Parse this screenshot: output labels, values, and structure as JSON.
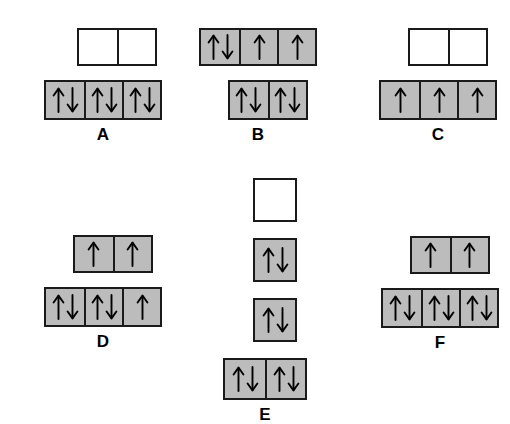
{
  "figure": {
    "background_color": "#ffffff",
    "box_fill_color": "#bcbcbc",
    "box_empty_color": "#ffffff",
    "box_border_color": "#1a1a1a",
    "arrow_color": "#000000"
  },
  "diagrams": [
    {
      "id": "A",
      "label": "A",
      "left": 44,
      "top": 28,
      "layout": "two-rows",
      "rows": [
        {
          "name": "upper-row",
          "box_width": 38,
          "box_height": 34,
          "offset_left": 27,
          "boxes": [
            {
              "fill": "empty",
              "electrons": ""
            },
            {
              "fill": "empty",
              "electrons": ""
            }
          ]
        },
        {
          "name": "lower-row",
          "box_width": 38,
          "box_height": 36,
          "offset_left": 0,
          "boxes": [
            {
              "fill": "filled",
              "electrons": "up-down"
            },
            {
              "fill": "filled",
              "electrons": "up-down"
            },
            {
              "fill": "filled",
              "electrons": "up-down"
            }
          ]
        }
      ]
    },
    {
      "id": "B",
      "label": "B",
      "left": 199,
      "top": 28,
      "layout": "two-rows",
      "rows": [
        {
          "name": "upper-row",
          "box_width": 38,
          "box_height": 34,
          "offset_left": 0,
          "boxes": [
            {
              "fill": "filled",
              "electrons": "up-down"
            },
            {
              "fill": "filled",
              "electrons": "up"
            },
            {
              "fill": "filled",
              "electrons": "up"
            }
          ]
        },
        {
          "name": "lower-row",
          "box_width": 38,
          "box_height": 36,
          "offset_left": 19,
          "boxes": [
            {
              "fill": "filled",
              "electrons": "up-down"
            },
            {
              "fill": "filled",
              "electrons": "up-down"
            }
          ]
        }
      ]
    },
    {
      "id": "C",
      "label": "C",
      "left": 379,
      "top": 28,
      "layout": "two-rows",
      "rows": [
        {
          "name": "upper-row",
          "box_width": 38,
          "box_height": 34,
          "offset_left": 19,
          "boxes": [
            {
              "fill": "empty",
              "electrons": ""
            },
            {
              "fill": "empty",
              "electrons": ""
            }
          ]
        },
        {
          "name": "lower-row",
          "box_width": 38,
          "box_height": 36,
          "offset_left": 0,
          "boxes": [
            {
              "fill": "filled",
              "electrons": "up"
            },
            {
              "fill": "filled",
              "electrons": "up"
            },
            {
              "fill": "filled",
              "electrons": "up"
            }
          ]
        }
      ]
    },
    {
      "id": "D",
      "label": "D",
      "left": 44,
      "top": 235,
      "layout": "two-rows",
      "rows": [
        {
          "name": "upper-row",
          "box_width": 38,
          "box_height": 34,
          "offset_left": 19,
          "boxes": [
            {
              "fill": "filled",
              "electrons": "up"
            },
            {
              "fill": "filled",
              "electrons": "up"
            }
          ]
        },
        {
          "name": "lower-row",
          "box_width": 38,
          "box_height": 36,
          "offset_left": 0,
          "boxes": [
            {
              "fill": "filled",
              "electrons": "up-down"
            },
            {
              "fill": "filled",
              "electrons": "up-down"
            },
            {
              "fill": "filled",
              "electrons": "up"
            }
          ]
        }
      ]
    },
    {
      "id": "E",
      "label": "E",
      "left": 223,
      "top": 178,
      "layout": "vertical-stack",
      "rows": [
        {
          "name": "level-1",
          "box_width": 40,
          "box_height": 40,
          "offset_left": 20,
          "boxes": [
            {
              "fill": "empty",
              "electrons": ""
            }
          ]
        },
        {
          "name": "level-2",
          "box_width": 40,
          "box_height": 40,
          "offset_left": 20,
          "boxes": [
            {
              "fill": "filled",
              "electrons": "up-down"
            }
          ]
        },
        {
          "name": "level-3",
          "box_width": 40,
          "box_height": 40,
          "offset_left": 20,
          "boxes": [
            {
              "fill": "filled",
              "electrons": "up-down"
            }
          ]
        },
        {
          "name": "level-4",
          "box_width": 40,
          "box_height": 38,
          "offset_left": 0,
          "boxes": [
            {
              "fill": "filled",
              "electrons": "up-down"
            },
            {
              "fill": "filled",
              "electrons": "up-down"
            }
          ]
        }
      ]
    },
    {
      "id": "F",
      "label": "F",
      "left": 381,
      "top": 236,
      "layout": "two-rows",
      "rows": [
        {
          "name": "upper-row",
          "box_width": 38,
          "box_height": 34,
          "offset_left": 19,
          "boxes": [
            {
              "fill": "filled",
              "electrons": "up"
            },
            {
              "fill": "filled",
              "electrons": "up"
            }
          ]
        },
        {
          "name": "lower-row",
          "box_width": 38,
          "box_height": 36,
          "offset_left": 0,
          "boxes": [
            {
              "fill": "filled",
              "electrons": "up-down"
            },
            {
              "fill": "filled",
              "electrons": "up-down"
            },
            {
              "fill": "filled",
              "electrons": "up-down"
            }
          ]
        }
      ]
    }
  ]
}
